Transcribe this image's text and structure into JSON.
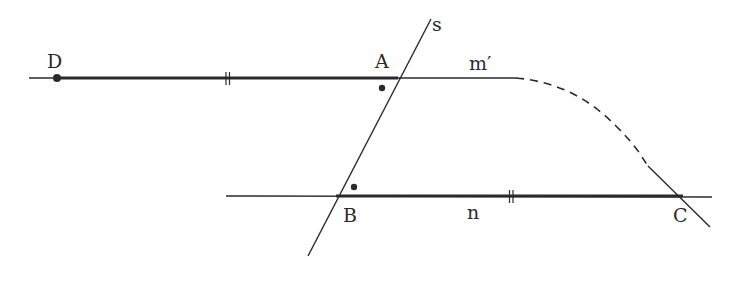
{
  "diagram": {
    "colors": {
      "stroke": "#2a2a2a",
      "background": "#ffffff"
    },
    "points": [
      {
        "id": "D",
        "label": "D",
        "x": 57,
        "y": 78
      },
      {
        "id": "A",
        "label": "A",
        "x": 398,
        "y": 78
      },
      {
        "id": "B",
        "label": "B",
        "x": 336,
        "y": 196
      },
      {
        "id": "C",
        "label": "C",
        "x": 683,
        "y": 196
      }
    ],
    "lines": [
      {
        "id": "m-prime",
        "label": "m′"
      },
      {
        "id": "n",
        "label": "n"
      },
      {
        "id": "s",
        "label": "s"
      }
    ],
    "segments": [
      {
        "from": "D",
        "to": "A",
        "tick_marks": 2,
        "emphasized": true
      },
      {
        "from": "B",
        "to": "C",
        "tick_marks": 2,
        "emphasized": true
      }
    ],
    "angle_markers": [
      {
        "at": "A",
        "marker": "dot"
      },
      {
        "at": "B",
        "marker": "dot"
      }
    ],
    "curve": {
      "style": "dashed",
      "from": "m-prime",
      "to": "C"
    }
  }
}
